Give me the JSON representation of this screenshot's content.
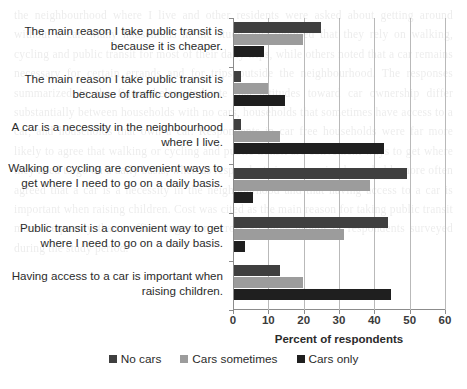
{
  "chart_data": {
    "type": "bar",
    "orientation": "horizontal",
    "title": "",
    "xlabel": "Percent of respondents",
    "ylabel": "",
    "xlim": [
      0,
      60
    ],
    "xticks": [
      0,
      10,
      20,
      30,
      40,
      50,
      60
    ],
    "grid": true,
    "legend_position": "bottom",
    "categories": [
      "The main reason I take public transit is because it is cheaper.",
      "The main reason I take public transit is because of traffic congestion.",
      "A car is a necessity in the neighbourhood where I live.",
      "Walking or cycling are convenient ways to get where I need to go on a daily basis.",
      "Public transit is a convenient way to get where I need to go on a daily basis.",
      "Having access to a car is important when raising children."
    ],
    "series": [
      {
        "name": "No cars",
        "color": "#3f3f3f",
        "values": [
          24.5,
          2.0,
          2.0,
          49.0,
          43.5,
          13.0
        ]
      },
      {
        "name": "Cars sometimes",
        "color": "#9c9c9c",
        "values": [
          19.5,
          9.5,
          13.0,
          38.5,
          31.0,
          19.5
        ]
      },
      {
        "name": "Cars only",
        "color": "#1f1f1f",
        "values": [
          8.5,
          14.5,
          42.5,
          5.5,
          3.0,
          44.5
        ]
      }
    ]
  },
  "legend": [
    {
      "label": "No cars",
      "swatch": "legend-swatch-no-cars",
      "color": "#3f3f3f"
    },
    {
      "label": "Cars sometimes",
      "swatch": "legend-swatch-cars-sometimes",
      "color": "#9c9c9c"
    },
    {
      "label": "Cars only",
      "swatch": "legend-swatch-cars-only",
      "color": "#1f1f1f"
    }
  ],
  "background_bleed": "the neighbourhood where I live and other residents were asked about getting around without a car. Many households in the study area reported that they rely on walking, cycling and public transit for most of their daily trips, while others noted that a car remains necessary for certain errands and for trips outside the neighbourhood. The responses summarized in the figure below indicate that attitudes toward car ownership differ substantially between households with no cars, households that sometimes have access to a car, and households that own a car. Respondents in car free households were far more likely to agree that walking or cycling and public transit are convenient ways to get where they need to go on a daily basis, whereas respondents in car owning households more often agreed that a car is a necessity in the neighbourhood and that having access to a car is important when raising children. Cost was cited as the main reason for taking public transit more frequently than traffic congestion across all three groups of respondents surveyed during the study period."
}
